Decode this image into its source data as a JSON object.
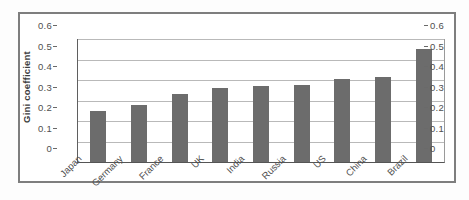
{
  "figure": {
    "background_color": "#ffffff",
    "frame_border_color": "#7e7e7e"
  },
  "chart_data": {
    "type": "bar",
    "categories": [
      "Japan",
      "Germany",
      "France",
      "UK",
      "India",
      "Russia",
      "US",
      "China",
      "Brazil"
    ],
    "values": [
      0.25,
      0.28,
      0.33,
      0.36,
      0.37,
      0.375,
      0.405,
      0.415,
      0.55
    ],
    "title": "",
    "xlabel": "",
    "ylabel": "Gini coefficient",
    "ylim": [
      0,
      0.6
    ],
    "ytick_values": [
      0,
      0.1,
      0.2,
      0.3,
      0.4,
      0.5,
      0.6
    ],
    "ytick_labels": [
      "0",
      "0.1",
      "0.2",
      "0.3",
      "0.4",
      "0.5",
      "0.6"
    ],
    "grid": true,
    "legend": "none",
    "mirrored_right_axis": true,
    "bar_color": "#6c6c6c",
    "gridline_color": "#b9b9b9",
    "axis_color": "#5f5f5f",
    "text_color": "#4f4f4f"
  }
}
